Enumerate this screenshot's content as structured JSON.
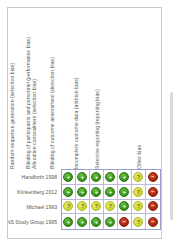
{
  "figure": {
    "type": "risk-of-bias-summary",
    "frame_color": "#c9c9c9",
    "background_color": "#ffffff"
  },
  "columns": [
    {
      "label": "Random sequence generation (selection bias)"
    },
    {
      "label": "Allocation concealment (selection bias)"
    },
    {
      "label": "Blinding of participants and personnel (performance bias)"
    },
    {
      "label": "Blinding of outcome assessment (detection bias)"
    },
    {
      "label": "Incomplete outcome data (attrition bias)"
    },
    {
      "label": "Selective reporting (reporting bias)"
    },
    {
      "label": "Other bias"
    }
  ],
  "rows": [
    {
      "study": "Handforth 1998"
    },
    {
      "study": "Klinkenberg 2012"
    },
    {
      "study": "Michael 1993"
    },
    {
      "study": "VNS Study Group 1995"
    }
  ],
  "judgement_symbols": {
    "low": "+",
    "unclear": "?",
    "high": "−"
  },
  "judgement_colors": {
    "low": "#3f9e21",
    "unclear": "#d6dd3e",
    "high": "#ad2b12"
  },
  "chart_data": {
    "type": "heatmap",
    "title": "",
    "xlabel": "",
    "ylabel": "",
    "categories": [
      "Random sequence generation (selection bias)",
      "Allocation concealment (selection bias)",
      "Blinding of participants and personnel (performance bias)",
      "Blinding of outcome assessment (detection bias)",
      "Incomplete outcome data (attrition bias)",
      "Selective reporting (reporting bias)",
      "Other bias"
    ],
    "series": [
      {
        "name": "Handforth 1998",
        "values": [
          "low",
          "low",
          "low",
          "low",
          "low",
          "unclear",
          "high"
        ]
      },
      {
        "name": "Klinkenberg 2012",
        "values": [
          "low",
          "low",
          "low",
          "low",
          "low",
          "unclear",
          "high"
        ]
      },
      {
        "name": "Michael 1993",
        "values": [
          "unclear",
          "unclear",
          "unclear",
          "unclear",
          "low",
          "unclear",
          "high"
        ]
      },
      {
        "name": "VNS Study Group 1995",
        "values": [
          "low",
          "low",
          "low",
          "low",
          "high",
          "unclear",
          "high"
        ]
      }
    ],
    "legend": [
      {
        "key": "low",
        "symbol": "+",
        "color": "#3f9e21"
      },
      {
        "key": "unclear",
        "symbol": "?",
        "color": "#d6dd3e"
      },
      {
        "key": "high",
        "symbol": "−",
        "color": "#ad2b12"
      }
    ],
    "grid": true,
    "legend_position": "none"
  }
}
